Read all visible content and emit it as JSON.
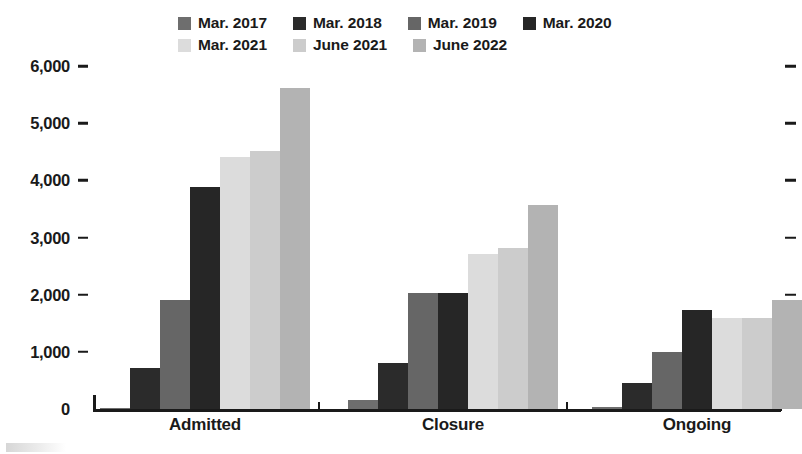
{
  "legend": {
    "items": [
      {
        "label": "Mar. 2017",
        "color": "#6e6e6e"
      },
      {
        "label": "Mar. 2018",
        "color": "#2b2b2b"
      },
      {
        "label": "Mar. 2019",
        "color": "#666666"
      },
      {
        "label": "Mar. 2020",
        "color": "#262626"
      },
      {
        "label": "Mar. 2021",
        "color": "#dcdcdc"
      },
      {
        "label": "June 2021",
        "color": "#cccccc"
      },
      {
        "label": "June 2022",
        "color": "#b3b3b3"
      }
    ]
  },
  "chart_data": {
    "type": "bar",
    "title": "",
    "xlabel": "",
    "ylabel": "",
    "categories": [
      "Admitted",
      "Closure",
      "Ongoing"
    ],
    "ylim": [
      0,
      6000
    ],
    "yticks": [
      0,
      1000,
      2000,
      3000,
      4000,
      5000,
      6000
    ],
    "ytick_labels": [
      "0",
      "1,000",
      "2,000",
      "3,000",
      "4,000",
      "5,000",
      "6,000"
    ],
    "grid": false,
    "legend_position": "top",
    "series": [
      {
        "name": "Mar. 2017",
        "color": "#6e6e6e",
        "values": [
          20,
          150,
          30
        ]
      },
      {
        "name": "Mar. 2018",
        "color": "#2b2b2b",
        "values": [
          720,
          800,
          460
        ]
      },
      {
        "name": "Mar. 2019",
        "color": "#666666",
        "values": [
          1900,
          2030,
          990
        ]
      },
      {
        "name": "Mar. 2020",
        "color": "#262626",
        "values": [
          3880,
          2030,
          1740
        ]
      },
      {
        "name": "Mar. 2021",
        "color": "#dcdcdc",
        "values": [
          4400,
          2720,
          1600
        ]
      },
      {
        "name": "June 2021",
        "color": "#cccccc",
        "values": [
          4520,
          2820,
          1600
        ]
      },
      {
        "name": "June 2022",
        "color": "#b3b3b3",
        "values": [
          5620,
          3570,
          1910
        ]
      }
    ]
  }
}
